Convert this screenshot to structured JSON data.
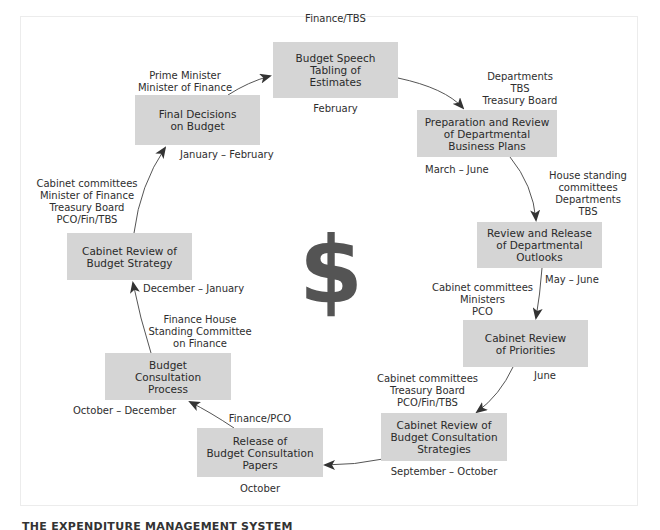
{
  "diagram": {
    "center_symbol": "$",
    "colors": {
      "box_fill": "#d5d5d5",
      "arrow": "#444444",
      "dollar": "#545454",
      "frame": "#ececec"
    },
    "stages": [
      {
        "id": "budget-speech",
        "lines": [
          "Budget Speech",
          "Tabling of",
          "Estimates"
        ],
        "actors": [
          "Finance/TBS"
        ],
        "timing": "February"
      },
      {
        "id": "preparation-review",
        "lines": [
          "Preparation and Review",
          "of Departmental",
          "Business Plans"
        ],
        "actors": [
          "Departments",
          "TBS",
          "Treasury Board"
        ],
        "timing": "March – June"
      },
      {
        "id": "review-release",
        "lines": [
          "Review and Release",
          "of Departmental",
          "Outlooks"
        ],
        "actors": [
          "House standing",
          "committees",
          "Departments",
          "TBS"
        ],
        "timing": "May – June"
      },
      {
        "id": "cabinet-review-priorities",
        "lines": [
          "Cabinet Review",
          "of Priorities"
        ],
        "actors": [
          "Cabinet committees",
          "Ministers",
          "PCO"
        ],
        "timing": "June"
      },
      {
        "id": "cabinet-review-consultation-strategies",
        "lines": [
          "Cabinet Review of",
          "Budget Consultation",
          "Strategies"
        ],
        "actors": [
          "Cabinet committees",
          "Treasury Board",
          "PCO/Fin/TBS"
        ],
        "timing": "September – October"
      },
      {
        "id": "release-consultation-papers",
        "lines": [
          "Release of",
          "Budget Consultation",
          "Papers"
        ],
        "actors": [
          "Finance/PCO"
        ],
        "timing": "October"
      },
      {
        "id": "budget-consultation-process",
        "lines": [
          "Budget",
          "Consultation",
          "Process"
        ],
        "actors": [
          "Finance House",
          "Standing Committee",
          "on Finance"
        ],
        "timing": "October – December"
      },
      {
        "id": "cabinet-review-budget-strategy",
        "lines": [
          "Cabinet Review of",
          "Budget Strategy"
        ],
        "actors": [
          "Cabinet committees",
          "Minister of Finance",
          "Treasury Board",
          "PCO/Fin/TBS"
        ],
        "timing": "December – January"
      },
      {
        "id": "final-decisions",
        "lines": [
          "Final Decisions",
          "on Budget"
        ],
        "actors": [
          "Prime Minister",
          "Minister of Finance"
        ],
        "timing": "January – February"
      }
    ]
  },
  "footer": {
    "caption": "THE EXPENDITURE MANAGEMENT SYSTEM"
  }
}
